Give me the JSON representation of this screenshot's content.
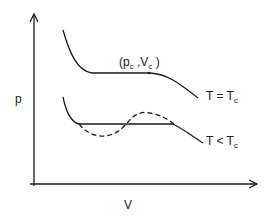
{
  "diagram": {
    "type": "p-V isotherms",
    "axes": {
      "y_label": "p",
      "x_label": "V"
    },
    "critical_point": {
      "label_open": "(p",
      "label_sub1": "c",
      "label_mid": " ,V",
      "label_sub2": "c",
      "label_close": " )"
    },
    "curves": [
      {
        "name": "critical-isotherm",
        "label_main": "T = T",
        "label_sub": "c",
        "style": "solid"
      },
      {
        "name": "subcritical-isotherm",
        "label_main": "T < T",
        "label_sub": "c",
        "style": "solid"
      },
      {
        "name": "van-der-waals-loop",
        "style": "dashed"
      }
    ],
    "colors": {
      "line": "#1a1a1a",
      "background": "#ffffff"
    }
  }
}
